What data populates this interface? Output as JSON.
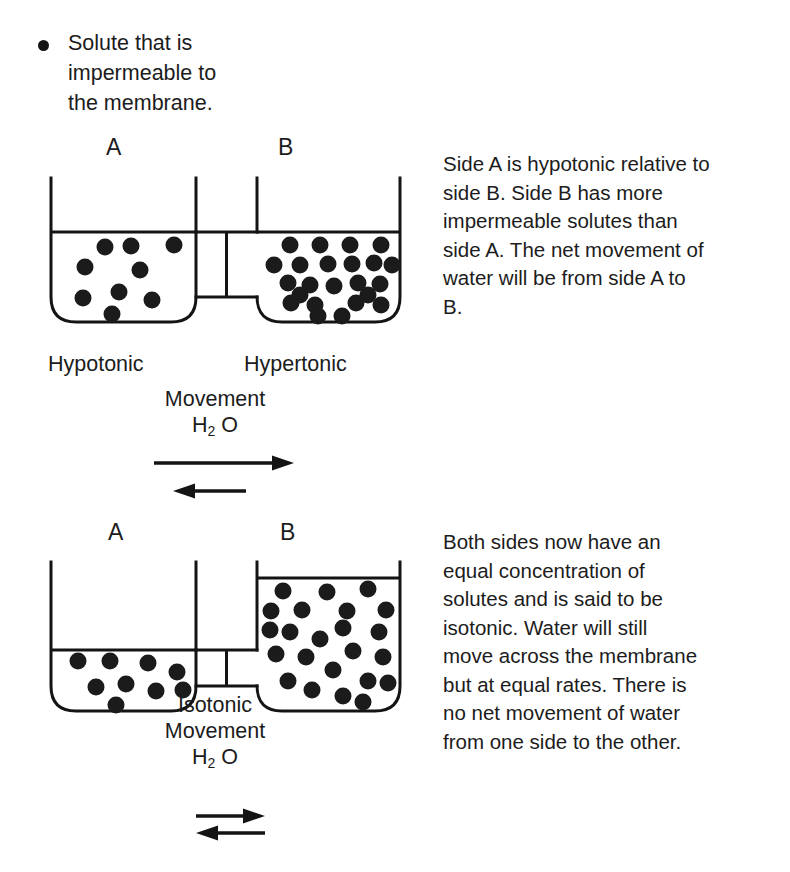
{
  "page": {
    "width": 790,
    "height": 872,
    "background": "#ffffff",
    "ink_color": "#141414"
  },
  "legend": {
    "bullet_icon": "filled-circle-bullet",
    "text": "Solute that is\nimpermeable to\nthe membrane."
  },
  "diagrams": [
    {
      "id": "hypotonic-hypertonic",
      "left_label": "A",
      "right_label": "B",
      "left_tonicity": "Hypotonic",
      "right_tonicity": "Hypertonic",
      "left_solute_count": 9,
      "right_solute_count": 23,
      "left_water_level": "high",
      "right_water_level": "high",
      "note": "Side A is hypotonic relative to\nside B. Side B has more\nimpermeable solutes than\nside A. The net movement of\nwater will be from side A to\nB.",
      "movement_caption": "Movement",
      "movement_formula_prefix": "H",
      "movement_formula_sub": "2",
      "movement_formula_suffix": " O",
      "arrows": {
        "forward": {
          "direction": "right",
          "length": "long",
          "meaning": "net water flow A to B"
        },
        "reverse": {
          "direction": "left",
          "length": "short",
          "meaning": "smaller back flow B to A"
        }
      }
    },
    {
      "id": "isotonic",
      "left_label": "A",
      "right_label": "B",
      "center_tonicity": "Isotonic",
      "left_solute_count": 9,
      "right_solute_count": 23,
      "left_water_level": "low",
      "right_water_level": "high",
      "note": "Both sides now have an\nequal concentration of\nsolutes and is said to be\nisotonic. Water will still\nmove across the membrane\nbut at equal rates. There is\nno net movement of water\nfrom one side to the other.",
      "movement_caption": "Movement",
      "movement_formula_prefix": "H",
      "movement_formula_sub": "2",
      "movement_formula_suffix": " O",
      "arrows": {
        "forward": {
          "direction": "right",
          "length": "equal",
          "meaning": "water flow A to B"
        },
        "reverse": {
          "direction": "left",
          "length": "equal",
          "meaning": "water flow B to A"
        }
      }
    }
  ]
}
